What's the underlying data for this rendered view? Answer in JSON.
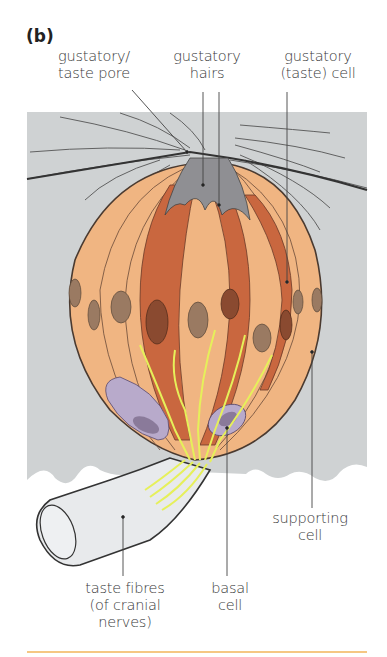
{
  "figure": {
    "panel_label": "(b)",
    "labels": {
      "taste_pore": {
        "line1": "gustatory/",
        "line2": "taste pore"
      },
      "gustatory_hairs": {
        "line1": "gustatory",
        "line2": "hairs"
      },
      "gustatory_cell": {
        "line1": "gustatory",
        "line2": "(taste) cell"
      },
      "supporting_cell": {
        "line1": "supporting",
        "line2": "cell"
      },
      "taste_fibres": {
        "line1": "taste fibres",
        "line2": "(of cranial",
        "line3": "nerves)"
      },
      "basal_cell": {
        "line1": "basal",
        "line2": "cell"
      }
    },
    "colors": {
      "epithelium_gray": "#cfd2d3",
      "supporting_cell_light": "#f0b582",
      "gustatory_cell_dark": "#c9673f",
      "nucleus_brown": "#9a7a62",
      "basal_cell_purple": "#b8aacb",
      "nerve_fibre_yellow": "#e6f05a",
      "pore_gray": "#8f8f93",
      "footer_rule": "#f2b45a"
    }
  }
}
